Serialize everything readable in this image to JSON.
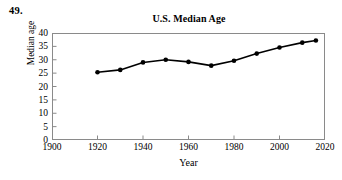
{
  "exercise_number": "49.",
  "chart_data": {
    "type": "line",
    "title": "U.S. Median Age",
    "xlabel": "Year",
    "ylabel": "Median age",
    "xlim": [
      1900,
      2020
    ],
    "ylim": [
      0,
      40
    ],
    "xticks": [
      1900,
      1920,
      1940,
      1960,
      1980,
      2000,
      2020
    ],
    "xtick_labels": [
      "1900",
      "1920",
      "1940",
      "1960",
      "1980",
      "2000",
      "2020"
    ],
    "yticks": [
      0,
      5,
      10,
      15,
      20,
      25,
      30,
      35,
      40
    ],
    "ytick_labels": [
      "0",
      "5",
      "10",
      "15",
      "20",
      "25",
      "30",
      "35",
      "40"
    ],
    "grid": false,
    "legend": false,
    "marker": "filled-circle",
    "line_color": "#000000",
    "marker_color": "#000000",
    "frame_color": "#8a8a8a",
    "x": [
      1920,
      1930,
      1940,
      1950,
      1960,
      1970,
      1980,
      1990,
      2000,
      2010,
      2016
    ],
    "values": [
      25.3,
      26.2,
      29.0,
      30.0,
      29.2,
      27.8,
      29.6,
      32.3,
      34.6,
      36.4,
      37.2
    ],
    "series": [
      {
        "name": "U.S. Median Age",
        "x": [
          1920,
          1930,
          1940,
          1950,
          1960,
          1970,
          1980,
          1990,
          2000,
          2010,
          2016
        ],
        "values": [
          25.3,
          26.2,
          29.0,
          30.0,
          29.2,
          27.8,
          29.6,
          32.3,
          34.6,
          36.4,
          37.2
        ]
      }
    ]
  }
}
